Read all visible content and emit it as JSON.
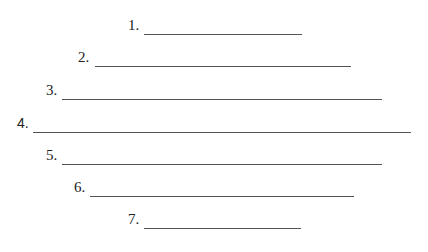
{
  "worksheet": {
    "items": [
      {
        "label": "1.",
        "label_x": 128,
        "line_x1": 144,
        "line_x2": 302,
        "y": 33
      },
      {
        "label": "2.",
        "label_x": 78,
        "line_x1": 95,
        "line_x2": 351,
        "y": 65
      },
      {
        "label": "3.",
        "label_x": 46,
        "line_x1": 62,
        "line_x2": 382,
        "y": 98
      },
      {
        "label": "4.",
        "label_x": 17,
        "line_x1": 33,
        "line_x2": 411,
        "y": 131,
        "sans": true
      },
      {
        "label": "5.",
        "label_x": 46,
        "line_x1": 62,
        "line_x2": 382,
        "y": 163
      },
      {
        "label": "6.",
        "label_x": 74,
        "line_x1": 90,
        "line_x2": 354,
        "y": 195
      },
      {
        "label": "7.",
        "label_x": 128,
        "line_x1": 144,
        "line_x2": 301,
        "y": 227
      }
    ]
  }
}
